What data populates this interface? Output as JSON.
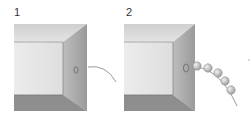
{
  "figure": {
    "panels": [
      {
        "label": "1",
        "description": "Open box viewed from front; a hole in the right inner wall with a single curved thread exiting",
        "beads": 0
      },
      {
        "label": "2",
        "description": "Same box; a chain of beads threaded on a string exits through the hole in the right wall",
        "beads": 5
      }
    ],
    "colors": {
      "top_wall": "#dcdcdc",
      "back_wall": "#e8e8e8",
      "side_wall": "#a9a9a9",
      "floor": "#8f8f8f",
      "bead": "#c8c8c8",
      "thread": "#9a9a9a"
    }
  }
}
